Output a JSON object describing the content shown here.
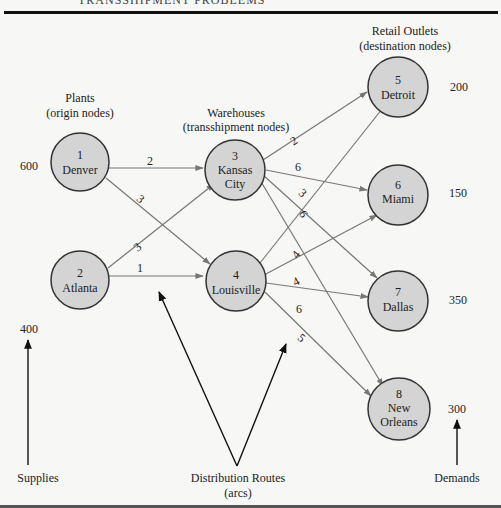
{
  "header": {
    "title": "TRANSSHIPMENT PROBLEMS"
  },
  "groups": {
    "plants": {
      "title": "Plants",
      "subtitle": "(origin nodes)"
    },
    "warehouses": {
      "title": "Warehouses",
      "subtitle": "(transshipment nodes)"
    },
    "retail": {
      "title": "Retail Outlets",
      "subtitle": "(destination nodes)"
    }
  },
  "nodes": [
    {
      "id": "1",
      "name": "Denver",
      "name2": "",
      "amount": "600"
    },
    {
      "id": "2",
      "name": "Atlanta",
      "name2": "",
      "amount": "400"
    },
    {
      "id": "3",
      "name": "Kansas",
      "name2": "City",
      "amount": ""
    },
    {
      "id": "4",
      "name": "Louisville",
      "name2": "",
      "amount": ""
    },
    {
      "id": "5",
      "name": "Detroit",
      "name2": "",
      "amount": "200"
    },
    {
      "id": "6",
      "name": "Miami",
      "name2": "",
      "amount": "150"
    },
    {
      "id": "7",
      "name": "Dallas",
      "name2": "",
      "amount": "350"
    },
    {
      "id": "8",
      "name": "New",
      "name2": "Orleans",
      "amount": "300"
    }
  ],
  "arcs": [
    {
      "from": "1",
      "to": "3",
      "cost": "2"
    },
    {
      "from": "1",
      "to": "4",
      "cost": "3"
    },
    {
      "from": "2",
      "to": "3",
      "cost": "3"
    },
    {
      "from": "2",
      "to": "4",
      "cost": "1"
    },
    {
      "from": "3",
      "to": "5",
      "cost": "2"
    },
    {
      "from": "3",
      "to": "6",
      "cost": "6"
    },
    {
      "from": "3",
      "to": "7",
      "cost": "3"
    },
    {
      "from": "3",
      "to": "8",
      "cost": "6"
    },
    {
      "from": "4",
      "to": "5",
      "cost": "4"
    },
    {
      "from": "4",
      "to": "6",
      "cost": "4"
    },
    {
      "from": "4",
      "to": "7",
      "cost": "6"
    },
    {
      "from": "4",
      "to": "8",
      "cost": "5"
    }
  ],
  "labels": {
    "supplies": "Supplies",
    "routes": "Distribution Routes",
    "routes_sub": "(arcs)",
    "demands": "Demands"
  },
  "colors": {
    "node_fill": "#d4d4d4",
    "node_stroke": "#333333",
    "arc": "#777777",
    "pointer": "#111111",
    "background": "#f7f7f5"
  }
}
